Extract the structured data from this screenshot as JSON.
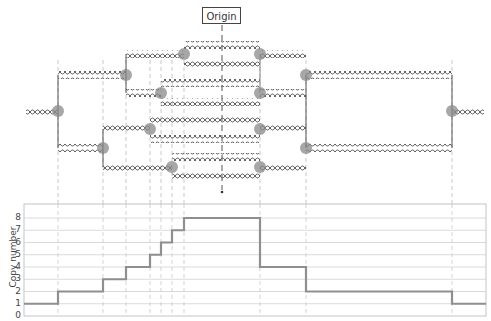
{
  "diagram": {
    "origin_label": "Origin",
    "colors": {
      "strand": "#555555",
      "fork_marker": "#8a8a8a",
      "guide": "#bbbbbb",
      "grid": "#d0d0d0",
      "step_line": "#8f8f8f",
      "frame": "#c4c4c4"
    },
    "fork_positions_x": [
      58,
      103,
      126,
      150,
      161,
      172,
      184,
      260,
      306,
      452
    ],
    "origin_x": 222
  },
  "chart_data": {
    "type": "line",
    "title": "",
    "xlabel": "",
    "ylabel": "Copy number",
    "yticks": [
      "0",
      "1",
      "2",
      "3",
      "4",
      "5",
      "6",
      "7",
      "8"
    ],
    "ylim": [
      0,
      8
    ],
    "grid": true,
    "step": true,
    "x_px": [
      24,
      58,
      103,
      126,
      150,
      161,
      172,
      184,
      260,
      306,
      452,
      486
    ],
    "values": [
      1,
      2,
      3,
      4,
      5,
      6,
      7,
      8,
      4,
      2,
      1
    ]
  }
}
